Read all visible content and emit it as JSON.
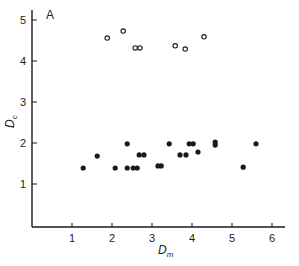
{
  "chart_data": {
    "type": "scatter",
    "title": "",
    "panel_label": "A",
    "xlabel": "D",
    "xlabel_sub": "m",
    "ylabel": "D",
    "ylabel_sub": "c",
    "xlim": [
      0,
      6.4
    ],
    "ylim": [
      0,
      5.2
    ],
    "x_ticks": [
      1,
      2,
      3,
      4,
      5,
      6
    ],
    "y_ticks": [
      1,
      2,
      3,
      4,
      5
    ],
    "grid": false,
    "legend": null,
    "series": [
      {
        "name": "open circles",
        "marker": "open-circle",
        "points": [
          {
            "x": 1.88,
            "y": 4.56
          },
          {
            "x": 2.28,
            "y": 4.73
          },
          {
            "x": 2.58,
            "y": 4.32
          },
          {
            "x": 2.7,
            "y": 4.32
          },
          {
            "x": 3.58,
            "y": 4.37
          },
          {
            "x": 3.83,
            "y": 4.29
          },
          {
            "x": 4.3,
            "y": 4.59
          }
        ]
      },
      {
        "name": "filled circles",
        "marker": "filled-circle",
        "points": [
          {
            "x": 1.28,
            "y": 1.39
          },
          {
            "x": 1.63,
            "y": 1.68
          },
          {
            "x": 2.08,
            "y": 1.39
          },
          {
            "x": 2.38,
            "y": 1.98
          },
          {
            "x": 2.38,
            "y": 1.39
          },
          {
            "x": 2.53,
            "y": 1.39
          },
          {
            "x": 2.63,
            "y": 1.39
          },
          {
            "x": 2.68,
            "y": 1.71
          },
          {
            "x": 2.8,
            "y": 1.71
          },
          {
            "x": 3.15,
            "y": 1.44
          },
          {
            "x": 3.23,
            "y": 1.44
          },
          {
            "x": 3.43,
            "y": 1.98
          },
          {
            "x": 3.7,
            "y": 1.71
          },
          {
            "x": 3.85,
            "y": 1.71
          },
          {
            "x": 3.93,
            "y": 1.98
          },
          {
            "x": 4.03,
            "y": 1.98
          },
          {
            "x": 4.15,
            "y": 1.78
          },
          {
            "x": 4.58,
            "y": 2.02
          },
          {
            "x": 4.58,
            "y": 1.95
          },
          {
            "x": 5.28,
            "y": 1.41
          },
          {
            "x": 5.6,
            "y": 1.98
          }
        ]
      }
    ]
  },
  "layout": {
    "origin_px": [
      32,
      225
    ],
    "x_px_per_unit": 40,
    "y_px_per_unit": 41,
    "axis_y_px": 227,
    "axis_x_end_px": 285,
    "axis_y_top_px": 10,
    "colors": {
      "ink": "#1a1a1a",
      "background": "#ffffff"
    }
  }
}
